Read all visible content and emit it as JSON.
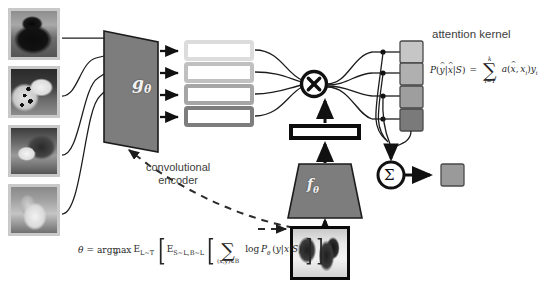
{
  "figure": {
    "background": "#ffffff"
  },
  "labels": {
    "attention_kernel": "attention kernel",
    "convolutional_encoder_line1": "convolutional",
    "convolutional_encoder_line2": "encoder",
    "support_encoder": "gθ",
    "query_encoder": "fθ",
    "multiply_symbol": "×",
    "sum_symbol": "Σ"
  },
  "formulas": {
    "attention": "P(ŷ|x̂|S) = ∑_{i=1}^{k} a(x̂, xᵢ) yᵢ",
    "objective": "θ = argmax_θ E_{L~T} [ E_{S~L,B~L} [ ∑_{(x,y)∈B} log P_θ (y|x|S) ] ]",
    "attention_parts": {
      "lhs": "P(ŷ|x̂|S)",
      "equals": "=",
      "sum_upper": "k",
      "sum_sign": "∑",
      "sum_lower": "i=1",
      "rhs": "a(x̂, xᵢ)yᵢ"
    },
    "objective_parts": {
      "theta": "θ",
      "equals": "=",
      "argmax": "argmax",
      "argmax_sub": "θ",
      "expect_outer": "E",
      "expect_outer_sub": "L~T",
      "expect_inner": "E",
      "expect_inner_sub": "S~L,B~L",
      "sum_sign": "∑",
      "sum_lower": "(x,y)∈B",
      "log_term": "log P",
      "log_sub": "θ",
      "prob": "(y|x|S)"
    }
  },
  "support_set": {
    "count": 4,
    "items": [
      {
        "name": "support-image-1",
        "alt": "black dog photo",
        "frame": "#c9c9c9"
      },
      {
        "name": "support-image-2",
        "alt": "dalmatian dog photo",
        "frame": "#c9c9c9"
      },
      {
        "name": "support-image-3",
        "alt": "husky dog photo",
        "frame": "#c9c9c9"
      },
      {
        "name": "support-image-4",
        "alt": "afghan hound photo",
        "frame": "#c9c9c9"
      }
    ]
  },
  "query": {
    "name": "query-image",
    "alt": "two huskies in snow photo",
    "frame": "#0a0a0a"
  },
  "embedding_bars": {
    "count": 4,
    "border_colors": [
      "#dcdcdc",
      "#c0c0c0",
      "#a6a6a6",
      "#7d7d7d"
    ],
    "fill": "#ffffff"
  },
  "attention_squares": {
    "count": 4,
    "fill_colors": [
      "#c6c6c6",
      "#b0b0b0",
      "#9e9e9e",
      "#7a7a7a"
    ],
    "border": "#4a4a4a"
  },
  "output": {
    "name": "output-square",
    "fill": "#9a9a9a",
    "border": "#4a4a4a"
  },
  "colors": {
    "encoder_fill": "#7d7d7d",
    "encoder_stroke": "#1c1c1c",
    "line": "#1c1c1c",
    "dashed_line": "#2b2b2b",
    "text": "#3d3d3d",
    "bar_black": "#0d0d0d"
  }
}
